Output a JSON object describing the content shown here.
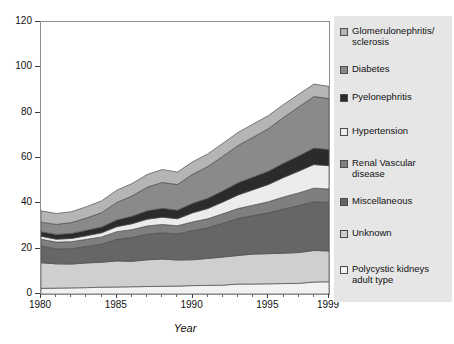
{
  "chart_data": {
    "type": "area",
    "title": "",
    "subtitle": "",
    "xlabel": "Year",
    "ylabel": "",
    "xlim": [
      1980,
      1999
    ],
    "ylim": [
      0,
      120
    ],
    "grid": false,
    "stacked": true,
    "legend_position": "right",
    "x": [
      1980,
      1981,
      1982,
      1983,
      1984,
      1985,
      1986,
      1987,
      1988,
      1989,
      1990,
      1991,
      1992,
      1993,
      1994,
      1995,
      1996,
      1997,
      1998,
      1999
    ],
    "xticks": [
      1980,
      1985,
      1990,
      1995,
      1999
    ],
    "xtick_labels": [
      "1980",
      "1985",
      "1990",
      "1995",
      "1999"
    ],
    "yticks": [
      0,
      20,
      40,
      60,
      80,
      100,
      120
    ],
    "ytick_labels": [
      "0",
      "20",
      "40",
      "60",
      "80",
      "100",
      "120"
    ],
    "series": [
      {
        "name": "Polycystic kidneys adult type",
        "color": "#f2f2f2",
        "values": [
          2.5,
          2.6,
          2.7,
          2.8,
          3.0,
          3.1,
          3.2,
          3.3,
          3.4,
          3.5,
          3.7,
          3.8,
          3.9,
          4.4,
          4.4,
          4.5,
          4.6,
          4.7,
          5.3,
          5.4
        ]
      },
      {
        "name": "Unknown",
        "color": "#cfcfcf",
        "values": [
          11.3,
          10.7,
          10.5,
          10.9,
          11.0,
          11.5,
          11.2,
          11.8,
          12.0,
          11.5,
          11.4,
          11.9,
          12.4,
          12.6,
          13.2,
          13.3,
          13.4,
          13.6,
          13.9,
          13.6
        ]
      },
      {
        "name": "Miscellaneous",
        "color": "#666666",
        "values": [
          7.4,
          6.6,
          6.8,
          7.3,
          8.0,
          9.5,
          10.5,
          11.3,
          11.6,
          11.5,
          12.9,
          13.5,
          14.9,
          16.3,
          17.0,
          18.0,
          19.5,
          20.7,
          21.5,
          21.4
        ]
      },
      {
        "name": "Renal Vascular disease",
        "color": "#7f7f7f",
        "values": [
          3.0,
          3.0,
          3.1,
          3.1,
          3.2,
          3.4,
          3.5,
          3.6,
          3.7,
          3.6,
          3.8,
          4.0,
          4.2,
          4.4,
          4.6,
          4.9,
          5.3,
          5.6,
          6.0,
          5.9
        ]
      },
      {
        "name": "Hypertension",
        "color": "#ececec",
        "values": [
          1.3,
          1.3,
          1.4,
          1.6,
          1.8,
          2.2,
          2.6,
          3.0,
          3.2,
          3.1,
          4.0,
          4.5,
          5.2,
          6.0,
          6.8,
          7.6,
          8.6,
          9.6,
          10.4,
          10.3
        ]
      },
      {
        "name": "Pyelonephritis",
        "color": "#2b2b2b",
        "values": [
          2.0,
          2.1,
          2.2,
          2.4,
          2.6,
          3.0,
          3.3,
          3.7,
          3.9,
          3.8,
          4.2,
          4.5,
          4.9,
          5.4,
          5.6,
          5.9,
          6.3,
          6.7,
          7.3,
          7.1
        ]
      },
      {
        "name": "Diabetes",
        "color": "#8a8a8a",
        "values": [
          4.2,
          4.4,
          4.8,
          5.4,
          6.3,
          7.7,
          8.9,
          10.4,
          11.4,
          11.3,
          12.8,
          14.0,
          15.3,
          16.4,
          17.6,
          18.7,
          20.2,
          21.6,
          22.7,
          22.5
        ]
      },
      {
        "name": "Glomerulonephritis/ sclerosis",
        "color": "#b5b5b5",
        "values": [
          5.0,
          4.8,
          4.8,
          5.0,
          5.2,
          5.4,
          5.5,
          5.6,
          5.7,
          5.5,
          5.5,
          5.6,
          5.7,
          5.8,
          5.8,
          5.8,
          5.7,
          5.6,
          5.5,
          5.4
        ]
      }
    ],
    "cumulative_top_1980": 36,
    "cumulative_top_1999": 102,
    "cumulative_peak_year": 1998,
    "cumulative_peak_value": 105
  },
  "axes": {
    "y_title": "",
    "x_title": "Year"
  },
  "legend": {
    "items": [
      {
        "label": "Glomerulonephritis/\nsclerosis",
        "color": "#b5b5b5",
        "icon": "legend-swatch"
      },
      {
        "label": "Diabetes",
        "color": "#8a8a8a",
        "icon": "legend-swatch"
      },
      {
        "label": "Pyelonephritis",
        "color": "#2b2b2b",
        "icon": "legend-swatch"
      },
      {
        "label": "Hypertension",
        "color": "#ececec",
        "icon": "legend-swatch"
      },
      {
        "label": "Renal Vascular\ndisease",
        "color": "#7f7f7f",
        "icon": "legend-swatch"
      },
      {
        "label": "Miscellaneous",
        "color": "#666666",
        "icon": "legend-swatch"
      },
      {
        "label": "Unknown",
        "color": "#cfcfcf",
        "icon": "legend-swatch"
      },
      {
        "label": "Polycystic kidneys\nadult type",
        "color": "#f2f2f2",
        "icon": "legend-swatch"
      }
    ],
    "background": "#e6e6e6"
  }
}
